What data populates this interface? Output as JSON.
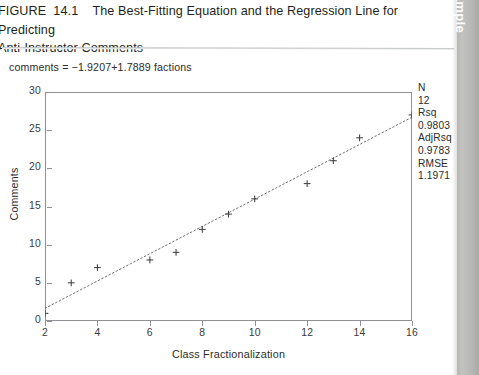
{
  "figure": {
    "label": "FIGURE  14.1",
    "title": "The Best-Fitting Equation and the Regression Line for Predicting Anti-Instructor Comments",
    "full_title": "FIGURE  14.1    The Best-Fitting Equation and the Regression Line for Predicting\nAnti-Instructor Comments",
    "equation": "comments = −1.9207+1.7889 factions"
  },
  "side_tab": {
    "label": "Example"
  },
  "stats": {
    "items": [
      {
        "key": "N",
        "value": "12"
      },
      {
        "key": "Rsq",
        "value": "0.9803"
      },
      {
        "key": "AdjRsq",
        "value": "0.9783"
      },
      {
        "key": "RMSE",
        "value": "1.1971"
      }
    ]
  },
  "chart_data": {
    "type": "scatter",
    "title": "The Best-Fitting Equation and the Regression Line for Predicting Anti-Instructor Comments",
    "subtitle": "comments = −1.9207+1.7889 factions",
    "xlabel": "Class Fractionalization",
    "ylabel": "Comments",
    "xlim": [
      2,
      16
    ],
    "ylim": [
      0,
      30
    ],
    "xticks": [
      2,
      4,
      6,
      8,
      10,
      12,
      14,
      16
    ],
    "yticks": [
      0,
      5,
      10,
      15,
      20,
      25,
      30
    ],
    "xtick_labels": [
      "2",
      "4",
      "6",
      "8",
      "10",
      "12",
      "14",
      "16"
    ],
    "ytick_labels": [
      "0",
      "5",
      "10",
      "15",
      "20",
      "25",
      "30"
    ],
    "grid": false,
    "legend": false,
    "marker": "plus",
    "marker_color": "#404040",
    "points": [
      {
        "x": 2,
        "y": 1
      },
      {
        "x": 3,
        "y": 5
      },
      {
        "x": 4,
        "y": 7
      },
      {
        "x": 6,
        "y": 8
      },
      {
        "x": 7,
        "y": 9
      },
      {
        "x": 8,
        "y": 12
      },
      {
        "x": 9,
        "y": 14
      },
      {
        "x": 10,
        "y": 16
      },
      {
        "x": 12,
        "y": 18
      },
      {
        "x": 13,
        "y": 21
      },
      {
        "x": 14,
        "y": 24
      },
      {
        "x": 16,
        "y": 27
      }
    ],
    "fit_line": {
      "style": "dotted",
      "color": "#6f6f6f",
      "intercept": -1.9207,
      "slope": 1.7889,
      "x_start": 2,
      "x_end": 16,
      "y_start": 1.6571,
      "y_end": 26.7017
    },
    "annotations": [
      {
        "text": "N",
        "value": "12"
      },
      {
        "text": "Rsq",
        "value": "0.9803"
      },
      {
        "text": "AdjRsq",
        "value": "0.9783"
      },
      {
        "text": "RMSE",
        "value": "1.1971"
      }
    ],
    "stats": {
      "N": 12,
      "Rsq": 0.9803,
      "AdjRsq": 0.9783,
      "RMSE": 1.1971
    }
  }
}
